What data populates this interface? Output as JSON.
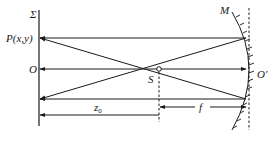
{
  "diagram": {
    "type": "optics-schematic",
    "labels": {
      "plane": "Σ",
      "point_p": "P(x,y)",
      "origin": "O",
      "source": "S",
      "mirror": "M",
      "mirror_vertex": "O′",
      "distance_z0": "z",
      "distance_z0_sub": "0",
      "focal_length": "f"
    },
    "colors": {
      "stroke": "#1a1a1a",
      "background": "#ffffff"
    }
  }
}
